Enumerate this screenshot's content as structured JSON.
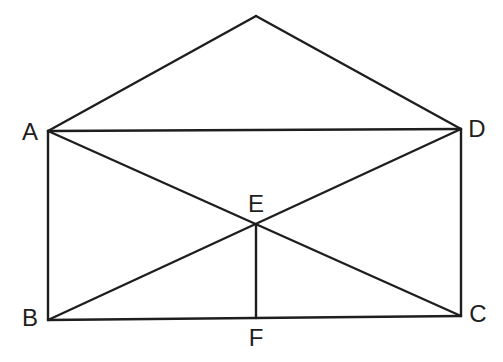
{
  "diagram": {
    "type": "geometry-figure",
    "points": {
      "apex": {
        "x": 256,
        "y": 16,
        "label": ""
      },
      "A": {
        "x": 48,
        "y": 131,
        "label": "A",
        "lx": 30,
        "ly": 134
      },
      "D": {
        "x": 461,
        "y": 129,
        "label": "D",
        "lx": 477,
        "ly": 131
      },
      "B": {
        "x": 48,
        "y": 320,
        "label": "B",
        "lx": 30,
        "ly": 320
      },
      "C": {
        "x": 461,
        "y": 316,
        "label": "C",
        "lx": 478,
        "ly": 316
      },
      "E": {
        "x": 256,
        "y": 225,
        "label": "E",
        "lx": 256,
        "ly": 206
      },
      "F": {
        "x": 256,
        "y": 318,
        "label": "F",
        "lx": 256,
        "ly": 340
      }
    },
    "segments": [
      [
        "A",
        "apex"
      ],
      [
        "apex",
        "D"
      ],
      [
        "A",
        "D"
      ],
      [
        "A",
        "B"
      ],
      [
        "D",
        "C"
      ],
      [
        "B",
        "C"
      ],
      [
        "A",
        "C"
      ],
      [
        "B",
        "D"
      ],
      [
        "E",
        "F"
      ]
    ],
    "stroke_color": "#1e1e1e"
  }
}
